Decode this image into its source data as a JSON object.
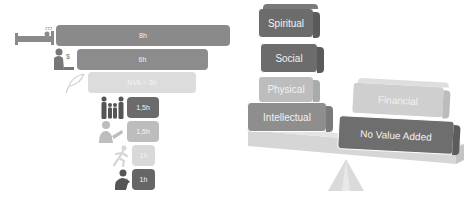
{
  "time_funnel": {
    "bars": [
      {
        "label": "8h",
        "icon": "sleeping-in-bed-icon",
        "color": "#8a8a8a"
      },
      {
        "label": "6h",
        "icon": "working-at-computer-icon",
        "color": "#8c8c8c"
      },
      {
        "label": "NVA = 3h",
        "icon": "feather-quill-icon",
        "color": "#dcdcdc"
      },
      {
        "label": "1,5h",
        "icon": "family-icon",
        "color": "#6b6b6b"
      },
      {
        "label": "1,5h",
        "icon": "reading-person-icon",
        "color": "#bdbdbd"
      },
      {
        "label": "1h",
        "icon": "running-person-icon",
        "color": "#d9d9d9"
      },
      {
        "label": "1h",
        "icon": "praying-person-icon",
        "color": "#666666"
      }
    ]
  },
  "balance": {
    "left_stack": [
      {
        "label": "Spiritual",
        "color": "#6c6c6c"
      },
      {
        "label": "Social",
        "color": "#6c6c6c"
      },
      {
        "label": "Physical",
        "color": "#bdbdbd"
      },
      {
        "label": "Intellectual",
        "color": "#8e8e8e"
      }
    ],
    "right_stack": [
      {
        "label": "Financial",
        "color": "#cfcfcf"
      },
      {
        "label": "No Value Added",
        "color": "#6e6e6e"
      }
    ],
    "plank_color": "#d6d6d6",
    "fulcrum_color": "#dadada"
  }
}
